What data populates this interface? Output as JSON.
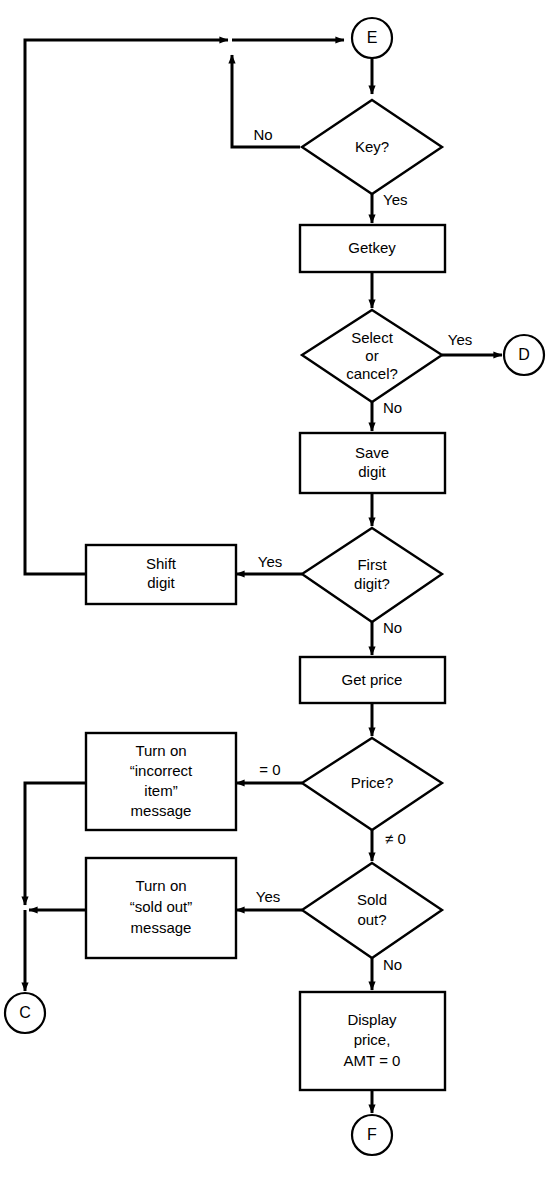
{
  "diagram": {
    "background_color": "#ffffff",
    "line_color": "#000000",
    "nodes": {
      "connector_e": {
        "label": "E",
        "shape": "circle"
      },
      "decision_key": {
        "label": "Key?",
        "shape": "diamond"
      },
      "process_getkey": {
        "label": "Getkey",
        "shape": "rectangle"
      },
      "decision_select_cancel": {
        "line1": "Select",
        "line2": "or",
        "line3": "cancel?",
        "shape": "diamond"
      },
      "connector_d": {
        "label": "D",
        "shape": "circle"
      },
      "process_save_digit": {
        "line1": "Save",
        "line2": "digit",
        "shape": "rectangle"
      },
      "decision_first_digit": {
        "line1": "First",
        "line2": "digit?",
        "shape": "diamond"
      },
      "process_shift_digit": {
        "line1": "Shift",
        "line2": "digit",
        "shape": "rectangle"
      },
      "process_get_price": {
        "label": "Get price",
        "shape": "rectangle"
      },
      "decision_price": {
        "label": "Price?",
        "shape": "diamond"
      },
      "process_incorrect_item": {
        "line1": "Turn on",
        "line2": "“incorrect",
        "line3": "item”",
        "line4": "message",
        "shape": "rectangle"
      },
      "decision_sold_out": {
        "line1": "Sold",
        "line2": "out?",
        "shape": "diamond"
      },
      "process_sold_out_msg": {
        "line1": "Turn on",
        "line2": "“sold out”",
        "line3": "message",
        "shape": "rectangle"
      },
      "connector_c": {
        "label": "C",
        "shape": "circle"
      },
      "process_display_price": {
        "line1": "Display",
        "line2": "price,",
        "line3": "AMT = 0",
        "shape": "rectangle"
      },
      "connector_f": {
        "label": "F",
        "shape": "circle"
      }
    },
    "edge_labels": {
      "key_no": "No",
      "key_yes": "Yes",
      "select_cancel_yes": "Yes",
      "select_cancel_no": "No",
      "first_digit_yes": "Yes",
      "first_digit_no": "No",
      "price_zero": "= 0",
      "price_nonzero": "≠ 0",
      "sold_out_yes": "Yes",
      "sold_out_no": "No"
    }
  }
}
